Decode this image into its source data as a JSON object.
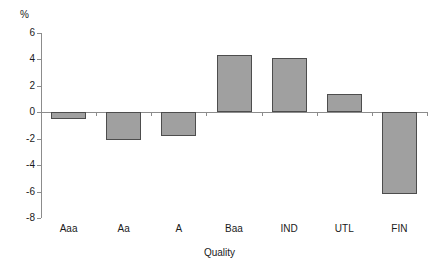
{
  "chart_data": {
    "type": "bar",
    "title": "",
    "subtitle": "",
    "xlabel": "Quality",
    "ylabel": "%",
    "unit_label": "%",
    "categories": [
      "Aaa",
      "Aa",
      "A",
      "Baa",
      "IND",
      "UTL",
      "FIN"
    ],
    "values": [
      -0.5,
      -2.1,
      -1.8,
      4.3,
      4.1,
      1.4,
      -6.2
    ],
    "series": [
      {
        "name": "Quality",
        "values": [
          -0.5,
          -2.1,
          -1.8,
          4.3,
          4.1,
          1.4,
          -6.2
        ]
      }
    ],
    "ylim": [
      -8,
      6
    ],
    "ytick_values": [
      6,
      4,
      2,
      0,
      -2,
      -4,
      -6,
      -8
    ],
    "ytick_labels": [
      "6",
      "4",
      "2",
      "0",
      "-2",
      "-4",
      "-6",
      "-8"
    ],
    "grid": false,
    "legend": false,
    "legend_position": "none",
    "bar_fill_color": "#a0a0a0",
    "bar_border_color": "#4d4d4d",
    "axis_color": "#8c8c8c",
    "text_color": "#1a1a1a",
    "background_color": "#ffffff"
  }
}
